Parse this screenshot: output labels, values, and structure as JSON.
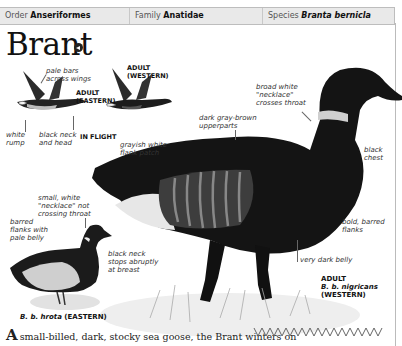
{
  "header": {
    "order_label": "Order",
    "order_value": "Anseriformes",
    "family_label": "Family",
    "family_value": "Anatidae",
    "species_label": "Species",
    "species_value": "Branta bernicla"
  },
  "title": "Brant",
  "icons": {
    "sound": "speaker-icon"
  },
  "flight": {
    "heading": "IN FLIGHT",
    "eastern_label": [
      "ADULT",
      "(EASTERN)"
    ],
    "western_label": [
      "ADULT",
      "(WESTERN)"
    ],
    "annotations": {
      "pale_bars": [
        "pale bars",
        "across wings"
      ],
      "white_rump": [
        "white",
        "rump"
      ],
      "black_neck": [
        "black neck",
        "and head"
      ]
    }
  },
  "main_bird": {
    "annotations": {
      "necklace": [
        "broad white",
        "\"necklace\"",
        "crosses throat"
      ],
      "upperparts": [
        "dark gray-brown",
        "upperparts"
      ],
      "flank_patch": [
        "grayish white",
        "flank patch"
      ],
      "chest": [
        "black",
        "chest"
      ],
      "flanks": [
        "bold, barred",
        "flanks"
      ],
      "belly": "very dark belly"
    },
    "caption": [
      "ADULT",
      "B. b. nigricans",
      "(WESTERN)"
    ]
  },
  "small_bird": {
    "annotations": {
      "necklace": [
        "small, white",
        "\"necklace\" not",
        "crossing throat"
      ],
      "flanks": [
        "barred",
        "flanks with",
        "pale belly"
      ],
      "neck": [
        "black neck",
        "stops abruptly",
        "at breast"
      ]
    },
    "caption_italic": "B. b. hrota",
    "caption_rest": "(EASTERN)"
  },
  "body_text": {
    "drop_cap": "A",
    "text": "small-billed, dark, stocky sea goose, the Brant winters on"
  }
}
